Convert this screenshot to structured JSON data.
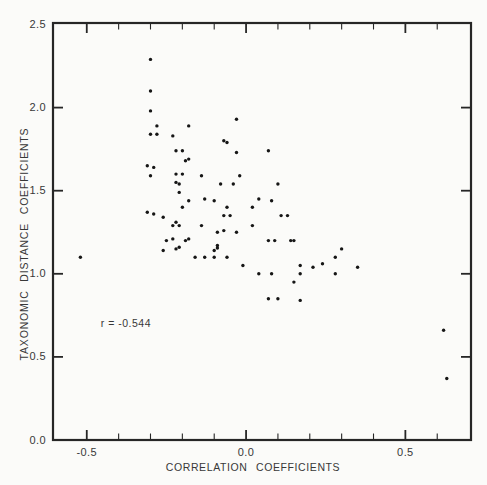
{
  "chart_data": {
    "type": "scatter",
    "title": "",
    "xlabel": "CORRELATION COEFFICIENTS",
    "ylabel": "TAXONOMIC DISTANCE COEFFICIENTS",
    "annotation": {
      "text": "r = -0.544",
      "x": -0.456,
      "y": 0.7
    },
    "xlim": [
      -0.606,
      0.706
    ],
    "ylim": [
      0,
      2.509
    ],
    "x_major_ticks": [
      -0.5,
      0.0,
      0.5
    ],
    "x_tick_labels": [
      "-0.5",
      "0.0",
      "0.5"
    ],
    "x_minor_tick_step": 0.1,
    "y_major_ticks": [
      0.0,
      0.5,
      1.0,
      1.5,
      2.0,
      2.5
    ],
    "y_tick_labels": [
      "0.0",
      "0.5",
      "1.0",
      "1.5",
      "2.0",
      "2.5"
    ],
    "grid": false,
    "legend": "none",
    "marker_color": "#161616",
    "frame_color": "#262626",
    "points": [
      [
        -0.3,
        2.29
      ],
      [
        -0.3,
        2.1
      ],
      [
        -0.3,
        1.98
      ],
      [
        -0.28,
        1.89
      ],
      [
        -0.3,
        1.84
      ],
      [
        -0.28,
        1.84
      ],
      [
        -0.23,
        1.83
      ],
      [
        -0.18,
        1.89
      ],
      [
        -0.03,
        1.93
      ],
      [
        -0.07,
        1.8
      ],
      [
        -0.22,
        1.74
      ],
      [
        -0.2,
        1.74
      ],
      [
        -0.03,
        1.73
      ],
      [
        -0.06,
        1.79
      ],
      [
        -0.19,
        1.68
      ],
      [
        -0.18,
        1.69
      ],
      [
        -0.31,
        1.65
      ],
      [
        -0.29,
        1.64
      ],
      [
        -0.22,
        1.6
      ],
      [
        -0.2,
        1.6
      ],
      [
        -0.3,
        1.59
      ],
      [
        -0.14,
        1.59
      ],
      [
        -0.02,
        1.59
      ],
      [
        -0.08,
        1.54
      ],
      [
        -0.04,
        1.54
      ],
      [
        -0.22,
        1.55
      ],
      [
        -0.21,
        1.54
      ],
      [
        -0.21,
        1.49
      ],
      [
        -0.18,
        1.44
      ],
      [
        -0.13,
        1.45
      ],
      [
        -0.1,
        1.44
      ],
      [
        -0.2,
        1.4
      ],
      [
        -0.06,
        1.4
      ],
      [
        -0.31,
        1.37
      ],
      [
        -0.29,
        1.36
      ],
      [
        -0.26,
        1.34
      ],
      [
        -0.07,
        1.35
      ],
      [
        -0.05,
        1.35
      ],
      [
        -0.22,
        1.31
      ],
      [
        -0.23,
        1.29
      ],
      [
        -0.21,
        1.29
      ],
      [
        -0.14,
        1.29
      ],
      [
        -0.09,
        1.25
      ],
      [
        -0.07,
        1.26
      ],
      [
        -0.03,
        1.25
      ],
      [
        -0.25,
        1.2
      ],
      [
        -0.23,
        1.21
      ],
      [
        -0.19,
        1.2
      ],
      [
        -0.18,
        1.21
      ],
      [
        -0.26,
        1.14
      ],
      [
        -0.22,
        1.15
      ],
      [
        -0.21,
        1.16
      ],
      [
        -0.09,
        1.17
      ],
      [
        -0.09,
        1.155
      ],
      [
        -0.1,
        1.14
      ],
      [
        -0.16,
        1.1
      ],
      [
        -0.13,
        1.1
      ],
      [
        -0.1,
        1.1
      ],
      [
        -0.06,
        1.1
      ],
      [
        -0.01,
        1.05
      ],
      [
        0.07,
        1.74
      ],
      [
        0.1,
        1.54
      ],
      [
        0.04,
        1.45
      ],
      [
        0.08,
        1.44
      ],
      [
        0.02,
        1.4
      ],
      [
        0.11,
        1.35
      ],
      [
        0.13,
        1.35
      ],
      [
        0.02,
        1.29
      ],
      [
        0.07,
        1.2
      ],
      [
        0.09,
        1.2
      ],
      [
        0.14,
        1.2
      ],
      [
        0.15,
        1.2
      ],
      [
        0.3,
        1.15
      ],
      [
        0.28,
        1.1
      ],
      [
        0.17,
        1.05
      ],
      [
        0.21,
        1.04
      ],
      [
        0.24,
        1.06
      ],
      [
        0.35,
        1.04
      ],
      [
        0.04,
        1.0
      ],
      [
        0.08,
        1.0
      ],
      [
        0.17,
        1.0
      ],
      [
        0.28,
        1.0
      ],
      [
        0.15,
        0.95
      ],
      [
        0.07,
        0.85
      ],
      [
        0.1,
        0.85
      ],
      [
        0.17,
        0.84
      ],
      [
        -0.52,
        1.1
      ],
      [
        0.62,
        0.66
      ],
      [
        0.63,
        0.37
      ]
    ]
  }
}
